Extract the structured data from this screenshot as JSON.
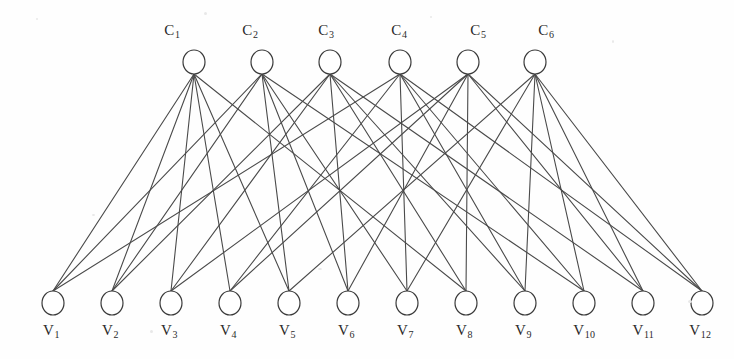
{
  "figure": {
    "type": "tanner-graph",
    "background_color": "#fefefe",
    "edge_color": "#4a4a4a",
    "node_stroke_color": "#3a3a3a",
    "node_fill_color": "#ffffff",
    "label_color": "#2a2a2a"
  },
  "geometry": {
    "width": 734,
    "height": 359,
    "check_row_y": 62,
    "variable_row_y": 303,
    "node_rx": 11,
    "node_ry": 12,
    "check_label_y": 22,
    "variable_label_y": 322
  },
  "check_nodes": [
    {
      "id": "C1",
      "label": "C",
      "sub": "1",
      "x": 194,
      "label_x": 172
    },
    {
      "id": "C2",
      "label": "C",
      "sub": "2",
      "x": 262,
      "label_x": 250
    },
    {
      "id": "C3",
      "label": "C",
      "sub": "3",
      "x": 330,
      "label_x": 326
    },
    {
      "id": "C4",
      "label": "C",
      "sub": "4",
      "x": 400,
      "label_x": 399
    },
    {
      "id": "C5",
      "label": "C",
      "sub": "5",
      "x": 468,
      "label_x": 478
    },
    {
      "id": "C6",
      "label": "C",
      "sub": "6",
      "x": 535,
      "label_x": 546
    }
  ],
  "variable_nodes": [
    {
      "id": "V1",
      "label": "V",
      "sub": "1",
      "x": 53,
      "label_x": 51
    },
    {
      "id": "V2",
      "label": "V",
      "sub": "2",
      "x": 112,
      "label_x": 110
    },
    {
      "id": "V3",
      "label": "V",
      "sub": "3",
      "x": 171,
      "label_x": 169
    },
    {
      "id": "V4",
      "label": "V",
      "sub": "4",
      "x": 230,
      "label_x": 228
    },
    {
      "id": "V5",
      "label": "V",
      "sub": "5",
      "x": 289,
      "label_x": 287
    },
    {
      "id": "V6",
      "label": "V",
      "sub": "6",
      "x": 348,
      "label_x": 346
    },
    {
      "id": "V7",
      "label": "V",
      "sub": "7",
      "x": 407,
      "label_x": 405
    },
    {
      "id": "V8",
      "label": "V",
      "sub": "8",
      "x": 466,
      "label_x": 464
    },
    {
      "id": "V9",
      "label": "V",
      "sub": "9",
      "x": 525,
      "label_x": 523
    },
    {
      "id": "V10",
      "label": "V",
      "sub": "10",
      "x": 584,
      "label_x": 584
    },
    {
      "id": "V11",
      "label": "V",
      "sub": "11",
      "x": 643,
      "label_x": 643
    },
    {
      "id": "V12",
      "label": "V",
      "sub": "12",
      "x": 702,
      "label_x": 700
    }
  ],
  "edges": [
    {
      "check": "C1",
      "variable": "V1"
    },
    {
      "check": "C1",
      "variable": "V2"
    },
    {
      "check": "C1",
      "variable": "V3"
    },
    {
      "check": "C1",
      "variable": "V4"
    },
    {
      "check": "C1",
      "variable": "V5"
    },
    {
      "check": "C1",
      "variable": "V8"
    },
    {
      "check": "C2",
      "variable": "V1"
    },
    {
      "check": "C2",
      "variable": "V2"
    },
    {
      "check": "C2",
      "variable": "V5"
    },
    {
      "check": "C2",
      "variable": "V6"
    },
    {
      "check": "C2",
      "variable": "V7"
    },
    {
      "check": "C2",
      "variable": "V10"
    },
    {
      "check": "C3",
      "variable": "V2"
    },
    {
      "check": "C3",
      "variable": "V3"
    },
    {
      "check": "C3",
      "variable": "V6"
    },
    {
      "check": "C3",
      "variable": "V8"
    },
    {
      "check": "C3",
      "variable": "V9"
    },
    {
      "check": "C3",
      "variable": "V11"
    },
    {
      "check": "C4",
      "variable": "V1"
    },
    {
      "check": "C4",
      "variable": "V4"
    },
    {
      "check": "C4",
      "variable": "V7"
    },
    {
      "check": "C4",
      "variable": "V9"
    },
    {
      "check": "C4",
      "variable": "V10"
    },
    {
      "check": "C4",
      "variable": "V12"
    },
    {
      "check": "C5",
      "variable": "V3"
    },
    {
      "check": "C5",
      "variable": "V4"
    },
    {
      "check": "C5",
      "variable": "V6"
    },
    {
      "check": "C5",
      "variable": "V8"
    },
    {
      "check": "C5",
      "variable": "V11"
    },
    {
      "check": "C5",
      "variable": "V12"
    },
    {
      "check": "C6",
      "variable": "V5"
    },
    {
      "check": "C6",
      "variable": "V7"
    },
    {
      "check": "C6",
      "variable": "V9"
    },
    {
      "check": "C6",
      "variable": "V10"
    },
    {
      "check": "C6",
      "variable": "V11"
    },
    {
      "check": "C6",
      "variable": "V12"
    }
  ],
  "degrees": {
    "check_node_degree": 6,
    "variable_node_degree": 3
  }
}
